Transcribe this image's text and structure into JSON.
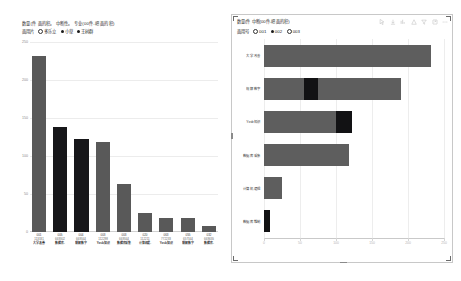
{
  "left": {
    "title": "数量(件 面的积。 中断性。 专业(00件-吧 面的积)",
    "legend": {
      "label": "面用片",
      "items": [
        {
          "marker": "star-hollow",
          "text": "多乐立"
        },
        {
          "marker": "dot-dark",
          "text": "小草"
        },
        {
          "marker": "dot-dark",
          "text": "王树群"
        }
      ]
    },
    "chart_data": {
      "type": "bar",
      "title": "数量(件 面的积。 中断性。 专业(00件-吧 面的积)",
      "xlabel": "",
      "ylabel": "",
      "ylim": [
        0,
        250
      ],
      "yticks": [
        0,
        50,
        100,
        150,
        200,
        250
      ],
      "grid": true,
      "categories": [
        "大学改善",
        "数据库.",
        "规解数字",
        "Yxsb知识",
        "数据库采集",
        "计算机逻辑",
        "Yxsb知识",
        "规解数字",
        "数据库."
      ],
      "bars": [
        {
          "code": "001",
          "num": "113331",
          "name": "大学改善",
          "value": 232,
          "color": "gray"
        },
        {
          "code": "005",
          "num": "669302",
          "name": "数据库.",
          "value": 138,
          "color": "dark"
        },
        {
          "code": "004",
          "num": "669344",
          "name": "规解数字",
          "value": 122,
          "color": "dark"
        },
        {
          "code": "003",
          "num": "112298",
          "name": "Yxsb知识",
          "value": 118,
          "color": "gray"
        },
        {
          "code": "003",
          "num": "669344",
          "name": "数据库采集",
          "value": 63,
          "color": "gray"
        },
        {
          "code": "020",
          "num": "112211",
          "name": "计算机逻.",
          "value": 25,
          "color": "gray"
        },
        {
          "code": "063",
          "num": "772233",
          "name": "Yxsb知识",
          "value": 18,
          "color": "gray"
        },
        {
          "code": "055",
          "num": "657344",
          "name": "规解数字",
          "value": 18,
          "color": "gray"
        },
        {
          "code": "032",
          "num": "669655",
          "name": "数据库.",
          "value": 8,
          "color": "gray"
        }
      ]
    }
  },
  "right": {
    "title": "数量(件 中断(00件-吧 面的积)",
    "legend": {
      "label": "面用号",
      "items": [
        {
          "marker": "dot-hollow",
          "text": "001"
        },
        {
          "marker": "dot-dark",
          "text": "002"
        },
        {
          "marker": "dot-hollow",
          "text": "003"
        }
      ]
    },
    "toolbar": [
      {
        "icon": "cursor-icon"
      },
      {
        "icon": "download-icon"
      },
      {
        "icon": "sort-icon"
      },
      {
        "icon": "chart-icon"
      },
      {
        "icon": "filter-icon"
      },
      {
        "icon": "export-icon"
      },
      {
        "icon": "more-icon"
      }
    ],
    "chart_data": {
      "type": "bar",
      "orientation": "horizontal",
      "title": "数量(件 中断(00件-吧 面的积)",
      "xlabel": "",
      "ylabel": "",
      "xlim": [
        0,
        250
      ],
      "xticks": [
        0,
        50,
        100,
        150,
        200,
        250
      ],
      "grid": true,
      "categories": [
        "大学改善",
        "规解数字",
        "Yxsb知识",
        "数据库采集",
        "计算机逻辑",
        "数据库维制"
      ],
      "series": [
        {
          "name": "总计",
          "values": [
            232,
            190,
            122,
            118,
            25,
            8
          ]
        }
      ],
      "highlight_segments": [
        {
          "category": "规解数字",
          "start": 55,
          "end": 75
        },
        {
          "category": "Yxsb知识",
          "start": 100,
          "end": 122
        },
        {
          "category": "数据库维制",
          "start": 0,
          "end": 8
        }
      ]
    }
  }
}
